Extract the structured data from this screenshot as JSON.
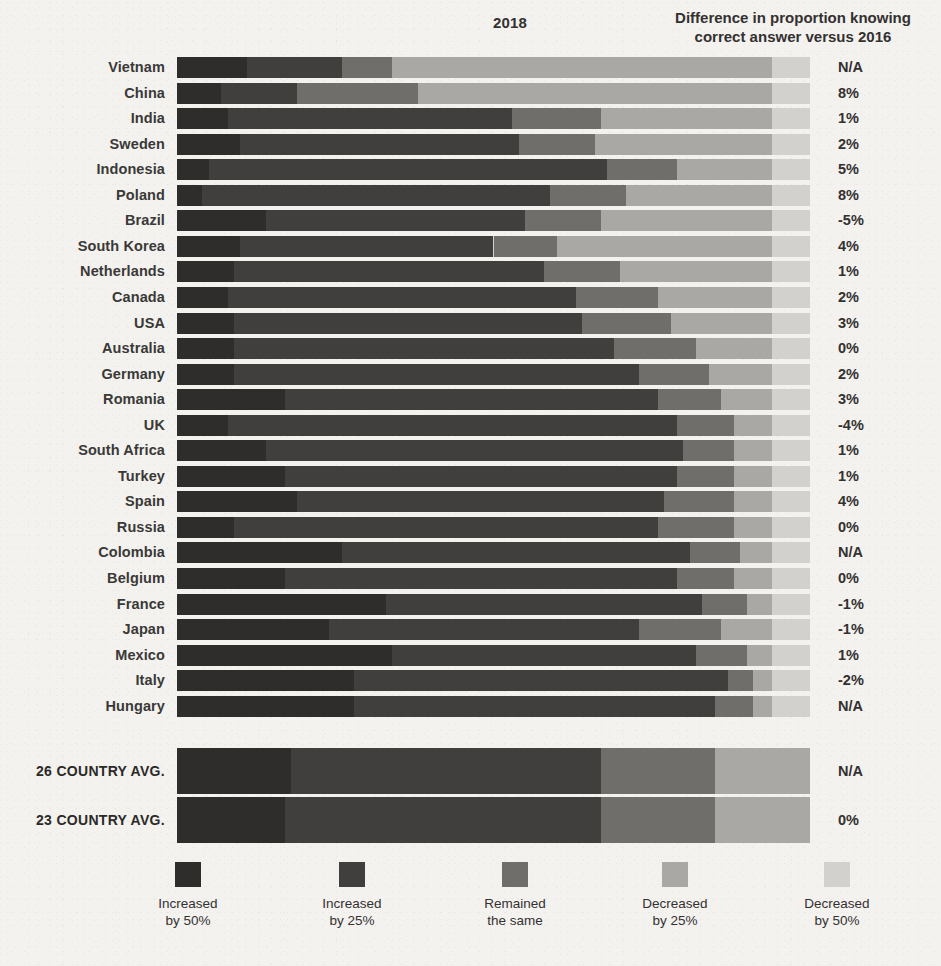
{
  "header": {
    "year_title": "2018",
    "diff_title_line1": "Difference in proportion knowing",
    "diff_title_line2": "correct answer versus 2016"
  },
  "legend": {
    "items": [
      {
        "label_line1": "Increased",
        "label_line2": "by 50%",
        "color": "#2e2d2b"
      },
      {
        "label_line1": "Increased",
        "label_line2": "by 25%",
        "color": "#403f3d"
      },
      {
        "label_line1": "Remained",
        "label_line2": "the same",
        "color": "#6f6e6b"
      },
      {
        "label_line1": "Decreased",
        "label_line2": "by 25%",
        "color": "#a9a8a4"
      },
      {
        "label_line1": "Decreased",
        "label_line2": "by 50%",
        "color": "#d3d1ce"
      }
    ]
  },
  "chart_data": {
    "type": "bar",
    "subtype": "stacked-horizontal-100",
    "title": "2018",
    "xlabel": "",
    "ylabel": "",
    "xlim": [
      0,
      100
    ],
    "grid": false,
    "legend_position": "bottom",
    "series": [
      {
        "name": "Increased by 50%",
        "color": "#2e2d2b"
      },
      {
        "name": "Increased by 25%",
        "color": "#403f3d"
      },
      {
        "name": "Remained the same",
        "color": "#6f6e6b"
      },
      {
        "name": "Decreased by 25%",
        "color": "#a9a8a4"
      },
      {
        "name": "Decreased by 50%",
        "color": "#d3d1ce"
      }
    ],
    "value_column_header": "Difference in proportion knowing correct answer versus 2016",
    "categories": [
      "Vietnam",
      "China",
      "India",
      "Sweden",
      "Indonesia",
      "Poland",
      "Brazil",
      "South Korea",
      "Netherlands",
      "Canada",
      "USA",
      "Australia",
      "Germany",
      "Romania",
      "UK",
      "South Africa",
      "Turkey",
      "Spain",
      "Russia",
      "Colombia",
      "Belgium",
      "France",
      "Japan",
      "Mexico",
      "Italy",
      "Hungary"
    ],
    "rows": [
      {
        "category": "Vietnam",
        "values": [
          11,
          15,
          8,
          60,
          6
        ],
        "difference": "N/A"
      },
      {
        "category": "China",
        "values": [
          7,
          12,
          19,
          56,
          6
        ],
        "difference": "8%"
      },
      {
        "category": "India",
        "values": [
          8,
          45,
          14,
          27,
          6
        ],
        "difference": "1%"
      },
      {
        "category": "Sweden",
        "values": [
          10,
          44,
          12,
          28,
          6
        ],
        "difference": "2%"
      },
      {
        "category": "Indonesia",
        "values": [
          5,
          63,
          11,
          15,
          6
        ],
        "difference": "5%"
      },
      {
        "category": "Poland",
        "values": [
          4,
          55,
          12,
          23,
          6
        ],
        "difference": "8%"
      },
      {
        "category": "Brazil",
        "values": [
          14,
          41,
          12,
          27,
          6
        ],
        "difference": "-5%"
      },
      {
        "category": "South Korea",
        "values": [
          10,
          40,
          10,
          34,
          6
        ],
        "difference": "4%"
      },
      {
        "category": "Netherlands",
        "values": [
          9,
          49,
          12,
          24,
          6
        ],
        "difference": "1%"
      },
      {
        "category": "Canada",
        "values": [
          8,
          55,
          13,
          18,
          6
        ],
        "difference": "2%"
      },
      {
        "category": "USA",
        "values": [
          9,
          55,
          14,
          16,
          6
        ],
        "difference": "3%"
      },
      {
        "category": "Australia",
        "values": [
          9,
          60,
          13,
          12,
          6
        ],
        "difference": "0%"
      },
      {
        "category": "Germany",
        "values": [
          9,
          64,
          11,
          10,
          6
        ],
        "difference": "2%"
      },
      {
        "category": "Romania",
        "values": [
          17,
          59,
          10,
          8,
          6
        ],
        "difference": "3%"
      },
      {
        "category": "UK",
        "values": [
          8,
          71,
          9,
          6,
          6
        ],
        "difference": "-4%"
      },
      {
        "category": "South Africa",
        "values": [
          14,
          66,
          8,
          6,
          6
        ],
        "difference": "1%"
      },
      {
        "category": "Turkey",
        "values": [
          17,
          62,
          9,
          6,
          6
        ],
        "difference": "1%"
      },
      {
        "category": "Spain",
        "values": [
          19,
          58,
          11,
          6,
          6
        ],
        "difference": "4%"
      },
      {
        "category": "Russia",
        "values": [
          9,
          67,
          12,
          6,
          6
        ],
        "difference": "0%"
      },
      {
        "category": "Colombia",
        "values": [
          26,
          55,
          8,
          5,
          6
        ],
        "difference": "N/A"
      },
      {
        "category": "Belgium",
        "values": [
          17,
          62,
          9,
          6,
          6
        ],
        "difference": "0%"
      },
      {
        "category": "France",
        "values": [
          33,
          50,
          7,
          4,
          6
        ],
        "difference": "-1%"
      },
      {
        "category": "Japan",
        "values": [
          24,
          49,
          13,
          8,
          6
        ],
        "difference": "-1%"
      },
      {
        "category": "Mexico",
        "values": [
          34,
          48,
          8,
          4,
          6
        ],
        "difference": "1%"
      },
      {
        "category": "Italy",
        "values": [
          28,
          59,
          4,
          3,
          6
        ],
        "difference": "-2%"
      },
      {
        "category": "Hungary",
        "values": [
          28,
          57,
          6,
          3,
          6
        ],
        "difference": "N/A"
      }
    ],
    "averages": [
      {
        "category": "26 COUNTRY AVG.",
        "values": [
          18,
          49,
          18,
          15,
          0
        ],
        "difference": "N/A"
      },
      {
        "category": "23 COUNTRY AVG.",
        "values": [
          17,
          50,
          18,
          15,
          0
        ],
        "difference": "0%"
      }
    ]
  }
}
